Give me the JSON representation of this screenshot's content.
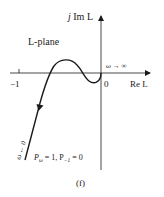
{
  "figure": {
    "label": "(f)",
    "plane_label": "L-plane",
    "axes": {
      "imag_label_j": "j",
      "imag_label_rest": "Im L",
      "real_label": "Re L",
      "origin_label": "0",
      "tick_minus_one": "−1"
    },
    "annotations": {
      "omega_inf": "ω → ∞",
      "omega_zero": "ω ← 0",
      "p_omega": "P",
      "p_omega_sub": "ω",
      "p_omega_val": " = 1, P",
      "p_minus_sub": "−1",
      "p_minus_val": " = 0"
    },
    "colors": {
      "stroke": "#1a1a1a",
      "background": "#ffffff"
    }
  }
}
